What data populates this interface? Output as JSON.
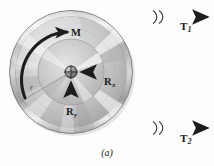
{
  "figure": {
    "caption": "(a)",
    "kind": "free-body-diagram-pulley",
    "background_color": "#fdfdfd"
  },
  "labels": {
    "tension_top": {
      "base": "T",
      "sub": "1"
    },
    "tension_bottom": {
      "base": "T",
      "sub": "2"
    },
    "moment": {
      "base": "M",
      "sub": ""
    },
    "reaction_x": {
      "base": "R",
      "sub": "x"
    },
    "reaction_y": {
      "base": "R",
      "sub": "y"
    },
    "radius": {
      "base": "r",
      "sub": ""
    }
  },
  "colors": {
    "arrow_dark": "#232323",
    "cable_gray": "#8c8c8c",
    "pulley_dark": "#6f6f6f",
    "pulley_light": "#f2f2f2",
    "pulley_mid": "#b9b9b9",
    "text": "#1a1a1a",
    "radius_line": "#9a9a9a"
  },
  "geometry": {
    "pulley_center_x": 71,
    "pulley_center_y": 72,
    "pulley_outer_radius": 62,
    "pulley_inner_radius": 33,
    "hub_radius": 6,
    "cable_top_y": 17,
    "cable_bottom_y": 128,
    "break_mark_x": 156
  }
}
